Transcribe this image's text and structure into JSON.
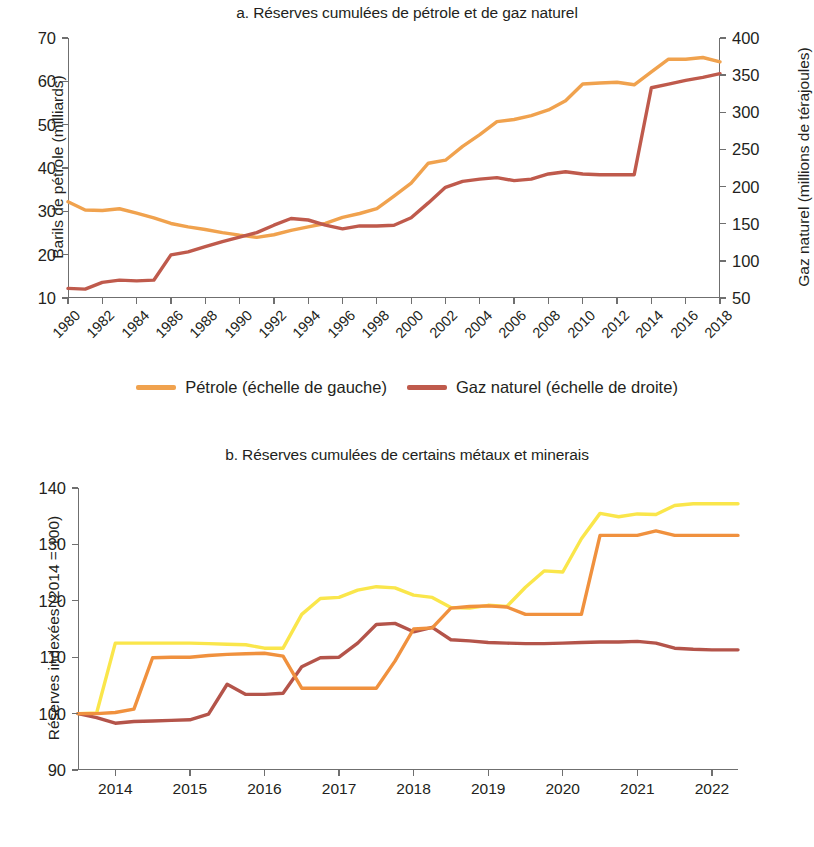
{
  "colors": {
    "petrole": "#F0A24E",
    "gaz": "#BF5A4C",
    "cobalt": "#F0913E",
    "cuivre": "#B4544A",
    "manganese": "#FAE64B",
    "axis": "#6f6f6f",
    "text": "#231f20"
  },
  "panel_a": {
    "title": "a. Réserves cumulées de pétrole et de gaz naturel",
    "y_left_title": "Barils de pétrole (milliards)",
    "y_right_title": "Gaz naturel (millions de térajoules)",
    "legend": [
      {
        "label": "Pétrole (échelle de gauche)",
        "color": "#F0A24E"
      },
      {
        "label": "Gaz naturel (échelle de droite)",
        "color": "#BF5A4C"
      }
    ]
  },
  "panel_b": {
    "title": "b. Réserves cumulées de certains métaux et minerais",
    "y_title": "Réserves indexées (2014 = 100)",
    "legend": [
      {
        "label": "Cobalt",
        "color": "#F0913E"
      },
      {
        "label": "Cuivre",
        "color": "#B4544A"
      },
      {
        "label": "Manganèse",
        "color": "#FAE64B"
      }
    ]
  },
  "chart_data": [
    {
      "type": "line",
      "id": "panel-a",
      "title": "a. Réserves cumulées de pétrole et de gaz naturel",
      "xlabel": "",
      "ylabel": "Barils de pétrole (milliards)",
      "y2label": "Gaz naturel (millions de térajoules)",
      "xlim": [
        1980,
        2018
      ],
      "ylim": [
        10,
        70
      ],
      "y2lim": [
        50,
        400
      ],
      "yticks": [
        10,
        20,
        30,
        40,
        50,
        60,
        70
      ],
      "y2ticks": [
        50,
        100,
        150,
        200,
        250,
        300,
        350,
        400
      ],
      "xticks": [
        1980,
        1982,
        1984,
        1986,
        1988,
        1990,
        1992,
        1994,
        1996,
        1998,
        2000,
        2002,
        2004,
        2006,
        2008,
        2010,
        2012,
        2014,
        2016,
        2018
      ],
      "xtick_labels": [
        "1980",
        "1982",
        "1984",
        "1986",
        "1988",
        "1990",
        "1992",
        "1994",
        "1996",
        "1998",
        "2000",
        "2002",
        "2004",
        "2006",
        "2008",
        "2010",
        "2012",
        "2014",
        "2016",
        "2018"
      ],
      "grid": false,
      "legend_position": "bottom",
      "x": [
        1980,
        1981,
        1982,
        1983,
        1984,
        1985,
        1986,
        1987,
        1988,
        1989,
        1990,
        1991,
        1992,
        1993,
        1994,
        1995,
        1996,
        1997,
        1998,
        1999,
        2000,
        2001,
        2002,
        2003,
        2004,
        2005,
        2006,
        2007,
        2008,
        2009,
        2010,
        2011,
        2012,
        2013,
        2014,
        2015,
        2016,
        2017,
        2018
      ],
      "series": [
        {
          "name": "Pétrole (échelle de gauche)",
          "axis": "left",
          "color": "#F0A24E",
          "unit": "milliards de barils",
          "values": [
            32.2,
            30.3,
            30.2,
            30.6,
            29.6,
            28.5,
            27.2,
            26.4,
            25.8,
            25.1,
            24.5,
            24.0,
            24.6,
            25.6,
            26.4,
            27.2,
            28.6,
            29.5,
            30.6,
            33.5,
            36.5,
            41.1,
            41.8,
            45.0,
            47.7,
            50.7,
            51.2,
            52.1,
            53.4,
            55.5,
            59.4,
            59.6,
            59.8,
            59.2,
            62.2,
            65.1,
            65.1,
            65.5,
            64.5
          ]
        },
        {
          "name": "Gaz naturel (échelle de droite)",
          "axis": "right",
          "color": "#BF5A4C",
          "unit": "millions de térajoules",
          "values": [
            63,
            62,
            71,
            74,
            73,
            74,
            108,
            112,
            119,
            126,
            132,
            138,
            148,
            157,
            155,
            148,
            143,
            147,
            147,
            148,
            158,
            178,
            199,
            207,
            210,
            212,
            208,
            210,
            217,
            220,
            217,
            216,
            216,
            216,
            333,
            338,
            343,
            347,
            352
          ]
        }
      ]
    },
    {
      "type": "line",
      "id": "panel-b",
      "title": "b. Réserves cumulées de certains métaux et minerais",
      "xlabel": "",
      "ylabel": "Réserves indexées (2014 = 100)",
      "xlim": [
        2013.5,
        2022.35
      ],
      "ylim": [
        90,
        140
      ],
      "yticks": [
        90,
        100,
        110,
        120,
        130,
        140
      ],
      "xticks": [
        2014,
        2015,
        2016,
        2017,
        2018,
        2019,
        2020,
        2021,
        2022
      ],
      "xtick_labels": [
        "2014",
        "2015",
        "2016",
        "2017",
        "2018",
        "2019",
        "2020",
        "2021",
        "2022"
      ],
      "grid": false,
      "legend_position": "bottom",
      "x": [
        2013.5,
        2013.75,
        2014,
        2014.25,
        2014.5,
        2014.75,
        2015,
        2015.25,
        2015.5,
        2015.75,
        2016,
        2016.25,
        2016.5,
        2016.75,
        2017,
        2017.25,
        2017.5,
        2017.75,
        2018,
        2018.25,
        2018.5,
        2018.75,
        2019,
        2019.25,
        2019.5,
        2019.75,
        2020,
        2020.25,
        2020.5,
        2020.75,
        2021,
        2021.25,
        2021.5,
        2021.75,
        2022,
        2022.35
      ],
      "series": [
        {
          "name": "Cobalt",
          "color": "#F0913E",
          "values": [
            100,
            100,
            100.2,
            100.8,
            109.9,
            110.0,
            110.0,
            110.3,
            110.5,
            110.6,
            110.7,
            110.2,
            104.5,
            104.5,
            104.5,
            104.5,
            104.5,
            109.3,
            115.0,
            115.2,
            118.7,
            119.0,
            119.1,
            118.9,
            117.6,
            117.6,
            117.6,
            117.6,
            131.6,
            131.6,
            131.6,
            132.4,
            131.6,
            131.6,
            131.6,
            131.6
          ]
        },
        {
          "name": "Cuivre",
          "color": "#B4544A",
          "values": [
            100,
            99.3,
            98.3,
            98.6,
            98.7,
            98.8,
            98.9,
            99.9,
            105.2,
            103.4,
            103.4,
            103.6,
            108.3,
            109.9,
            110.0,
            112.5,
            115.8,
            116.0,
            114.5,
            115.3,
            113.1,
            112.9,
            112.6,
            112.5,
            112.4,
            112.4,
            112.5,
            112.6,
            112.7,
            112.7,
            112.8,
            112.5,
            111.6,
            111.4,
            111.3,
            111.3
          ]
        },
        {
          "name": "Manganèse",
          "color": "#FAE64B",
          "values": [
            100,
            100.1,
            112.5,
            112.5,
            112.5,
            112.5,
            112.5,
            112.4,
            112.3,
            112.2,
            111.6,
            111.6,
            117.6,
            120.4,
            120.6,
            121.9,
            122.5,
            122.3,
            121.0,
            120.6,
            118.8,
            118.7,
            119.2,
            119.0,
            122.4,
            125.3,
            125.1,
            131.0,
            135.5,
            134.9,
            135.4,
            135.3,
            136.9,
            137.2,
            137.2,
            137.2
          ]
        }
      ]
    }
  ]
}
